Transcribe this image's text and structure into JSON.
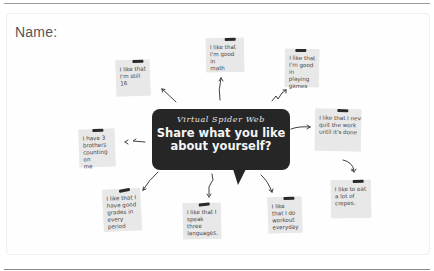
{
  "worksheet": {
    "name_label": "Name:",
    "title_script": "Virtual Spider Web",
    "question_line1": "Share what you like",
    "question_line2": "about yourself?",
    "notes": [
      {
        "id": "still-16",
        "lines": [
          "I like that",
          "I'm still 16"
        ]
      },
      {
        "id": "good-math",
        "lines": [
          "I like that",
          "I'm good in",
          "math"
        ]
      },
      {
        "id": "playing-games",
        "lines": [
          "I like that",
          "I'm good in",
          "playing",
          "games"
        ]
      },
      {
        "id": "never-quit",
        "lines": [
          "I like that I never",
          "quit the work",
          "until it's done"
        ]
      },
      {
        "id": "eat-crepes",
        "lines": [
          "I like to eat",
          "a lot of",
          "crepes."
        ]
      },
      {
        "id": "three-brothers",
        "lines": [
          "I have 3",
          "brothers",
          "counting on",
          "me"
        ]
      },
      {
        "id": "good-grades",
        "lines": [
          "I like that I",
          "have good",
          "grades in",
          "every period"
        ]
      },
      {
        "id": "three-languages",
        "lines": [
          "I like that I",
          "speak three",
          "languages."
        ]
      },
      {
        "id": "workout",
        "lines": [
          "I like",
          "that I do",
          "workout",
          "everyday"
        ]
      }
    ]
  },
  "colors": {
    "bubble": "#262626",
    "note": "#e8e8e8",
    "tape": "#2a2a2a",
    "text": "#555555"
  }
}
